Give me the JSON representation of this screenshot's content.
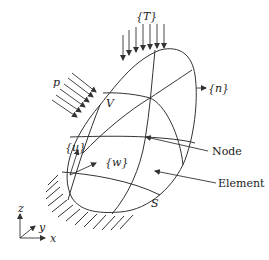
{
  "diagram": {
    "labels": {
      "traction": "{T}",
      "pressure": "p",
      "volume": "V",
      "normal": "{n}",
      "displacement_u": "{u}",
      "displacement_w": "{w}",
      "node": "Node",
      "element": "Element",
      "surface": "S",
      "axis_z": "z",
      "axis_y": "y",
      "axis_x": "x"
    },
    "colors": {
      "line": "#333333",
      "text": "#222222",
      "background": "#ffffff"
    }
  }
}
